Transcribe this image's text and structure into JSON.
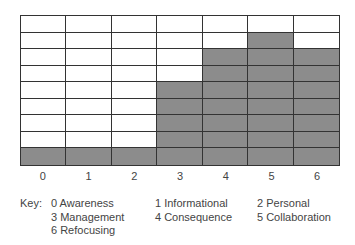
{
  "chart_data": {
    "type": "bar",
    "style": "stacked-grid-cells",
    "title": "",
    "xlabel": "",
    "ylabel": "",
    "categories": [
      "0",
      "1",
      "2",
      "3",
      "4",
      "5",
      "6"
    ],
    "values": [
      1,
      1,
      1,
      5,
      7,
      8,
      7
    ],
    "ylim": [
      0,
      9
    ],
    "grid": true,
    "fill_color": "#8c8c8c",
    "legend_title": "Key:",
    "legend": [
      {
        "code": "0",
        "label": "Awareness"
      },
      {
        "code": "1",
        "label": "Informational"
      },
      {
        "code": "2",
        "label": "Personal"
      },
      {
        "code": "3",
        "label": "Management"
      },
      {
        "code": "4",
        "label": "Consequence"
      },
      {
        "code": "5",
        "label": "Collaboration"
      },
      {
        "code": "6",
        "label": "Refocusing"
      }
    ],
    "legend_position": "bottom"
  },
  "key_label": "Key:",
  "key_items": [
    "0  Awareness",
    "1  Informational",
    "2  Personal",
    "3  Management",
    "4  Consequence",
    "5  Collaboration",
    "6  Refocusing"
  ]
}
